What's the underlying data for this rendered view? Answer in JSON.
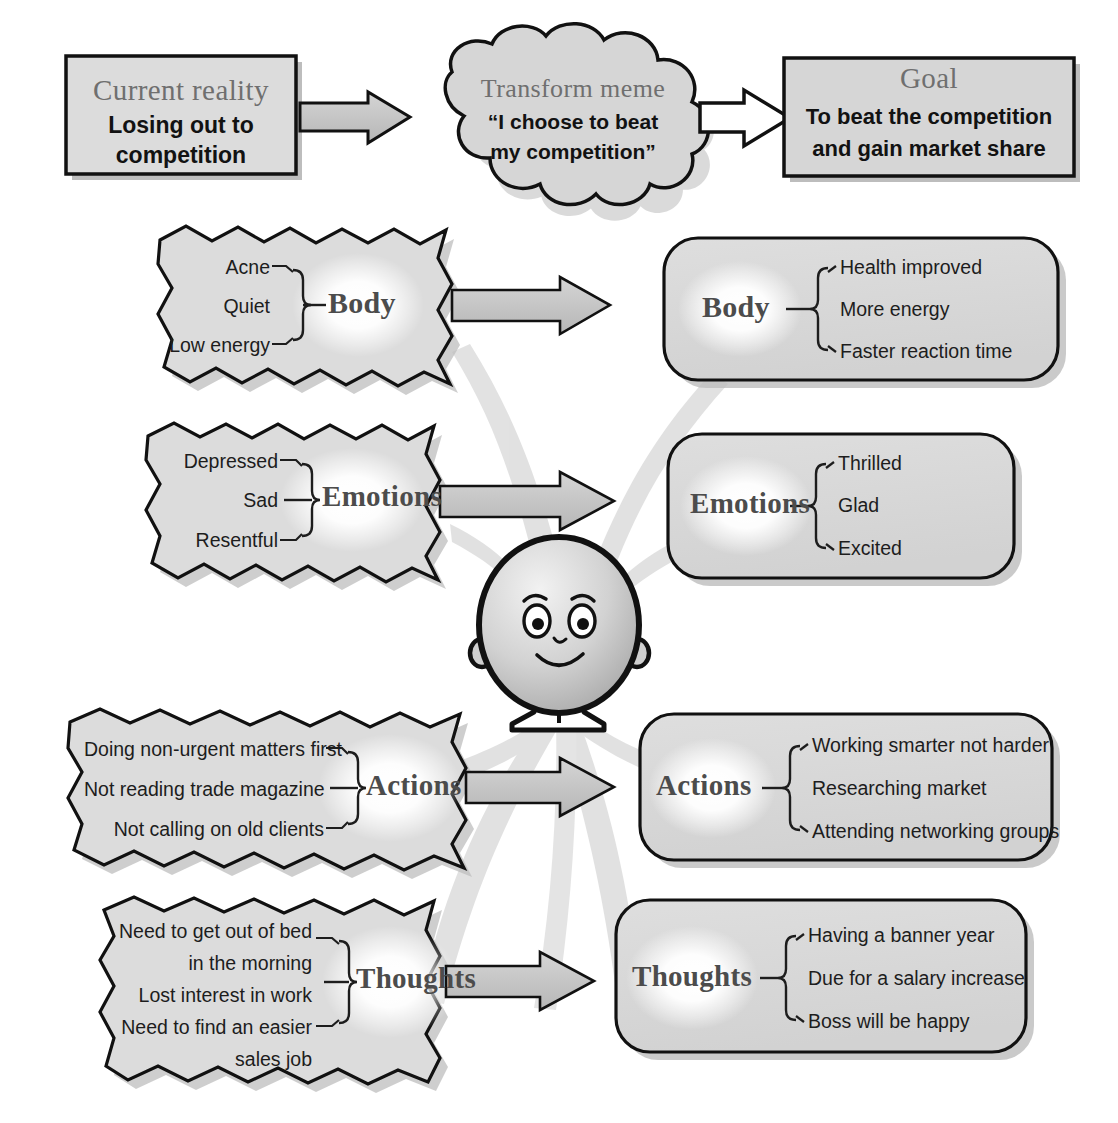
{
  "diagram": {
    "title_row": {
      "current_reality": {
        "heading": "Current reality",
        "body_line1": "Losing out to",
        "body_line2": "competition"
      },
      "transform_meme": {
        "heading": "Transform meme",
        "body_line1": "“I choose to beat",
        "body_line2": "my competition”"
      },
      "goal": {
        "heading": "Goal",
        "body_line1": "To beat the competition",
        "body_line2": "and gain market share"
      }
    },
    "rows": [
      {
        "id": "body",
        "label": "Body",
        "left_items": [
          "Acne",
          "Quiet",
          "Low energy"
        ],
        "right_items": [
          "Health improved",
          "More energy",
          "Faster reaction time"
        ]
      },
      {
        "id": "emotions",
        "label": "Emotions",
        "left_items": [
          "Depressed",
          "Sad",
          "Resentful"
        ],
        "right_items": [
          "Thrilled",
          "Glad",
          "Excited"
        ]
      },
      {
        "id": "actions",
        "label": "Actions",
        "left_items": [
          "Doing non-urgent matters first",
          "Not reading trade magazine",
          "Not calling on old clients"
        ],
        "right_items": [
          "Working smarter not harder",
          "Researching market",
          "Attending networking groups"
        ]
      },
      {
        "id": "thoughts",
        "label": "Thoughts",
        "left_items_lines": [
          [
            "Need to get out of bed",
            "in the morning"
          ],
          [
            "Lost interest in work"
          ],
          [
            "Need to find an easier",
            "sales job"
          ]
        ],
        "right_items": [
          "Having a banner year",
          "Due for a salary increase",
          "Boss will be happy"
        ]
      }
    ],
    "figure": {
      "name": "character-figure",
      "expression": "smiling"
    },
    "colors": {
      "box_fill": "#d9d9d9",
      "box_fill_light": "#e0e0e0",
      "outline": "#111111",
      "arrow_fill": "#c9c9c9",
      "ribbon": "#d8d8d8",
      "shadow": "#bdbdbd",
      "heading_text": "#6f6f6f",
      "body_text": "#121212",
      "node_text": "#4c4c4c",
      "page_bg": "#ffffff"
    }
  }
}
